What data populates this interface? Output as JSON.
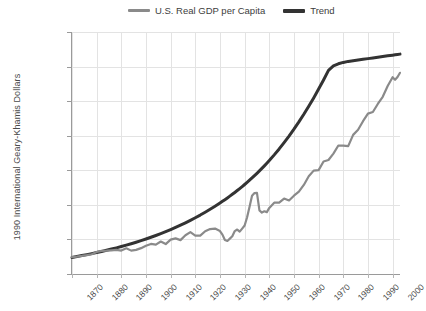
{
  "legend": {
    "position": "top-center",
    "entries": [
      {
        "label": "U.S. Real GDP per Capita",
        "color": "#8a8a8a",
        "marker": "line-swatch"
      },
      {
        "label": "Trend",
        "color": "#333333",
        "marker": "line-swatch"
      }
    ]
  },
  "axes": {
    "ylabel": "1990 International Geary-Khamis Dollars",
    "xlabel": "",
    "ytick_labels": [
      "$35,0000",
      "$30,000",
      "$25,000",
      "$20,000",
      "$15,000",
      "$10,000",
      "$5,000",
      "0"
    ],
    "ytick_values": [
      35000,
      30000,
      25000,
      20000,
      15000,
      10000,
      5000,
      0
    ],
    "xtick_labels": [
      "1870",
      "1880",
      "1890",
      "1900",
      "1910",
      "1920",
      "1930",
      "1940",
      "1950",
      "1960",
      "1970",
      "1980",
      "1990",
      "2000"
    ],
    "xtick_values": [
      1870,
      1880,
      1890,
      1900,
      1910,
      1920,
      1930,
      1940,
      1950,
      1960,
      1970,
      1980,
      1990,
      2000
    ],
    "ylim": [
      0,
      35000
    ],
    "xlim": [
      1870,
      2003
    ],
    "grid": true
  },
  "chart_data": {
    "type": "line",
    "title": "",
    "xlabel": "",
    "ylabel": "1990 International Geary-Khamis Dollars",
    "ylim": [
      0,
      35000
    ],
    "xlim": [
      1870,
      2003
    ],
    "grid": true,
    "legend_position": "top-center",
    "x": [
      1870,
      1872,
      1874,
      1876,
      1878,
      1880,
      1882,
      1884,
      1886,
      1888,
      1890,
      1892,
      1894,
      1896,
      1898,
      1900,
      1902,
      1904,
      1906,
      1908,
      1910,
      1912,
      1914,
      1916,
      1918,
      1920,
      1922,
      1924,
      1926,
      1928,
      1930,
      1931,
      1932,
      1933,
      1934,
      1935,
      1936,
      1937,
      1938,
      1939,
      1940,
      1941,
      1942,
      1943,
      1944,
      1945,
      1946,
      1947,
      1948,
      1949,
      1950,
      1952,
      1954,
      1956,
      1958,
      1960,
      1962,
      1964,
      1966,
      1968,
      1970,
      1972,
      1974,
      1976,
      1978,
      1980,
      1982,
      1984,
      1986,
      1988,
      1990,
      1992,
      1994,
      1996,
      1998,
      2000,
      2001,
      2002,
      2003
    ],
    "series": [
      {
        "name": "U.S. Real GDP per Capita",
        "color": "#8a8a8a",
        "width": 2.2,
        "values": [
          2445,
          2520,
          2610,
          2720,
          2860,
          3184,
          3350,
          3380,
          3430,
          3480,
          3392,
          3720,
          3380,
          3490,
          3740,
          4091,
          4350,
          4240,
          4700,
          4330,
          4964,
          5150,
          4900,
          5600,
          6050,
          5552,
          5540,
          6180,
          6500,
          6570,
          6213,
          5690,
          4908,
          4777,
          5114,
          5467,
          6204,
          6430,
          6126,
          6561,
          7010,
          8206,
          9741,
          11320,
          11709,
          11722,
          9197,
          8886,
          9065,
          8944,
          9561,
          10316,
          10330,
          10914,
          10640,
          11328,
          11904,
          12880,
          14130,
          14950,
          15030,
          16280,
          16490,
          17420,
          18580,
          18577,
          18490,
          20120,
          20860,
          22100,
          23201,
          23430,
          24590,
          25630,
          27200,
          28467,
          28100,
          28500,
          29100
        ]
      },
      {
        "name": "Trend",
        "color": "#333333",
        "width": 3.0,
        "values": [
          2400,
          2530,
          2665,
          2805,
          2950,
          3105,
          3265,
          3430,
          3605,
          3785,
          3975,
          4175,
          4380,
          4595,
          4825,
          5060,
          5310,
          5570,
          5840,
          6125,
          6425,
          6735,
          7060,
          7400,
          7760,
          8135,
          8525,
          8935,
          9360,
          9805,
          10270,
          10510,
          10755,
          11005,
          11260,
          11525,
          11795,
          12070,
          12355,
          12645,
          12945,
          13250,
          13565,
          13890,
          14220,
          14560,
          14910,
          15270,
          15640,
          16020,
          16410,
          17230,
          18090,
          19000,
          19950,
          20950,
          22000,
          23100,
          24260,
          25470,
          26740,
          28070,
          29460,
          30100,
          30400,
          30600,
          30750,
          30850,
          30950,
          31050,
          31150,
          31250,
          31350,
          31450,
          31550,
          31650,
          31700,
          31750,
          31800
        ]
      }
    ],
    "annotations": [
      {
        "label": "Great Depression trough",
        "x": 1933,
        "y": 4777
      },
      {
        "label": "WWII peak",
        "x": 1944,
        "y": 11709
      }
    ]
  }
}
